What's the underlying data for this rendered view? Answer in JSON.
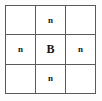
{
  "canvas": {
    "width": 102,
    "height": 101,
    "background_color": "#fdfdfd"
  },
  "grid": {
    "rows": 3,
    "columns": 3,
    "line_color": "#5a5a5a",
    "cell_background_color": "#ffffff",
    "text_color": "#161616",
    "cells": [
      {
        "id": "cell-top-left",
        "row": 1,
        "col": 1,
        "text": "",
        "size": "small",
        "empty": true
      },
      {
        "id": "cell-top-center",
        "row": 1,
        "col": 2,
        "text": "n",
        "size": "small",
        "empty": false
      },
      {
        "id": "cell-top-right",
        "row": 1,
        "col": 3,
        "text": "",
        "size": "small",
        "empty": true
      },
      {
        "id": "cell-middle-left",
        "row": 2,
        "col": 1,
        "text": "n",
        "size": "small",
        "empty": false
      },
      {
        "id": "cell-middle-center",
        "row": 2,
        "col": 2,
        "text": "B",
        "size": "large",
        "empty": false
      },
      {
        "id": "cell-middle-right",
        "row": 2,
        "col": 3,
        "text": "n",
        "size": "small",
        "empty": false
      },
      {
        "id": "cell-bottom-left",
        "row": 3,
        "col": 1,
        "text": "",
        "size": "small",
        "empty": true
      },
      {
        "id": "cell-bottom-center",
        "row": 3,
        "col": 2,
        "text": "n",
        "size": "small",
        "empty": false
      },
      {
        "id": "cell-bottom-right",
        "row": 3,
        "col": 3,
        "text": "",
        "size": "small",
        "empty": true
      }
    ]
  }
}
